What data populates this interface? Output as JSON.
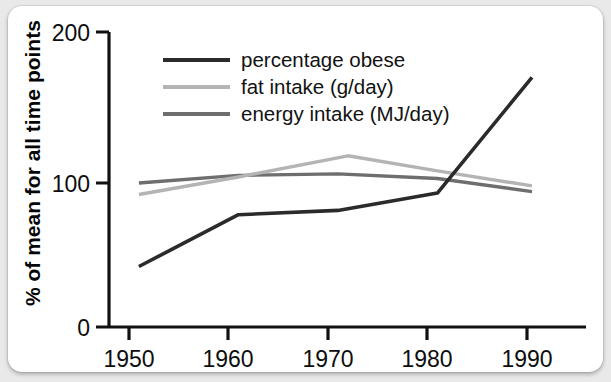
{
  "chart_data": {
    "type": "line",
    "title": "",
    "xlabel": "",
    "ylabel": "% of mean for all time points",
    "xlim": [
      1948,
      1994
    ],
    "ylim": [
      0,
      200
    ],
    "xticks": [
      1950,
      1960,
      1970,
      1980,
      1990
    ],
    "yticks": [
      0,
      100,
      200
    ],
    "grid": false,
    "legend_position": "top-left",
    "series": [
      {
        "name": "percentage obese",
        "color": "#2b2b2b",
        "x": [
          1951,
          1961,
          1971,
          1981,
          1990.5
        ],
        "values": [
          42,
          78,
          81,
          93,
          170
        ]
      },
      {
        "name": "fat intake (g/day)",
        "color": "#b4b4b4",
        "x": [
          1951,
          1961,
          1972,
          1981,
          1990.5
        ],
        "values": [
          92,
          104,
          118,
          108,
          98
        ]
      },
      {
        "name": "energy intake (MJ/day)",
        "color": "#6e6e6e",
        "x": [
          1951,
          1961,
          1971,
          1981,
          1990.5
        ],
        "values": [
          100,
          105,
          106,
          103,
          94
        ]
      }
    ]
  },
  "axes": {
    "y_tick_labels": [
      "200",
      "100",
      "0"
    ],
    "x_tick_labels": [
      "1950",
      "1960",
      "1970",
      "1980",
      "1990"
    ],
    "y_axis_title": "% of mean for all time points"
  },
  "legend": {
    "entries": [
      {
        "label": "percentage obese",
        "swatch": "line-swatch-dark"
      },
      {
        "label": "fat intake (g/day)",
        "swatch": "line-swatch-light"
      },
      {
        "label": "energy intake (MJ/day)",
        "swatch": "line-swatch-medium"
      }
    ]
  },
  "colors": {
    "background": "#e9e9e9",
    "card": "#ffffff",
    "axis": "#111111",
    "series_obese": "#2b2b2b",
    "series_fat": "#b4b4b4",
    "series_energy": "#6e6e6e"
  }
}
